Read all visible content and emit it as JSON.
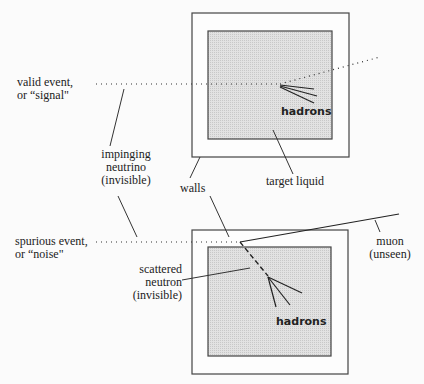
{
  "diagram": {
    "labels": {
      "valid_event": [
        "valid event,",
        "or “signal\""
      ],
      "impinging_neutrino": [
        "impinging",
        "neutrino",
        "(invisible)"
      ],
      "walls": "walls",
      "target_liquid": "target liquid",
      "hadrons_top": "hadrons",
      "spurious_event": [
        "spurious event,",
        "or “noise\""
      ],
      "scattered_neutron": [
        "scattered",
        "neutron",
        "(invisible)"
      ],
      "muon": [
        "muon",
        "(unseen)"
      ],
      "hadrons_bottom": "hadrons"
    },
    "colors": {
      "line": "#333333",
      "liquid_fill": "#d9d9d9",
      "background": "#fbfbfb"
    }
  }
}
